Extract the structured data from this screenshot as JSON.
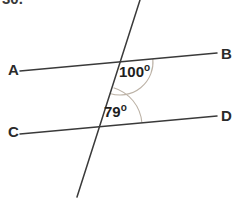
{
  "figure": {
    "type": "geometry-diagram",
    "background_color": "#ffffff",
    "line_color": "#3a3a3a",
    "arc_color": "#bcb2a6",
    "text_color": "#1e1e1e"
  },
  "question_number": "30.",
  "vertices": {
    "A": "A",
    "B": "B",
    "C": "C",
    "D": "D"
  },
  "angles": {
    "upper": {
      "value": "100",
      "degree_symbol": "o",
      "full": "100o"
    },
    "lower": {
      "value": "79",
      "degree_symbol": "o",
      "full": "79o"
    }
  },
  "geometry": {
    "line_ab": {
      "x1": 20,
      "y1": 71,
      "x2": 217,
      "y2": 53
    },
    "line_cd": {
      "x1": 20,
      "y1": 134,
      "x2": 217,
      "y2": 116
    },
    "transversal": {
      "x1": 140,
      "y1": 0,
      "x2": 77,
      "y2": 197
    },
    "intersection_upper": {
      "x": 120,
      "y": 62
    },
    "intersection_lower": {
      "x": 102,
      "y": 126
    },
    "arc_upper": {
      "cx": 120,
      "cy": 62,
      "r": 33
    },
    "arc_lower": {
      "cx": 102,
      "cy": 126,
      "r": 40
    }
  }
}
